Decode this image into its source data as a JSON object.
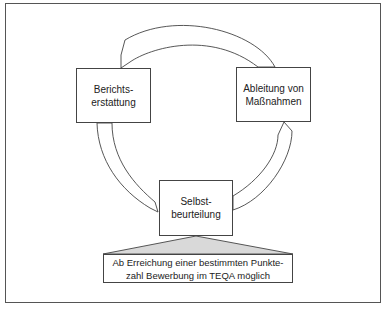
{
  "diagram": {
    "type": "cycle",
    "nodes": [
      {
        "id": "berichtserstattung",
        "lines": [
          "Berichts-",
          "erstattung"
        ]
      },
      {
        "id": "ableitung",
        "lines": [
          "Ableitung von",
          "Maßnahmen"
        ]
      },
      {
        "id": "selbstbeurteilung",
        "lines": [
          "Selbst-",
          "beurteilung"
        ]
      }
    ],
    "edges": [
      {
        "from": "selbstbeurteilung",
        "to": "ableitung"
      },
      {
        "from": "ableitung",
        "to": "berichtserstattung"
      },
      {
        "from": "berichtserstattung",
        "to": "selbstbeurteilung"
      }
    ],
    "note": {
      "lines": [
        "Ab Erreichung einer bestimmten Punkte-",
        "zahl Bewerbung im TEQA möglich"
      ],
      "attached_to": "selbstbeurteilung"
    },
    "colors": {
      "stroke": "#444444",
      "callout_fill": "#d9d9d9",
      "background": "#ffffff"
    }
  }
}
